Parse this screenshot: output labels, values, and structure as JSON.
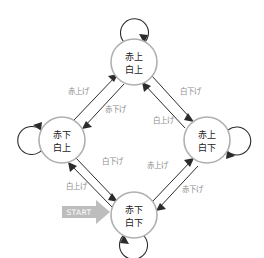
{
  "diagram": {
    "nodes": [
      {
        "id": "top",
        "line1": "赤上",
        "line2": "白上",
        "cx": 134,
        "cy": 62,
        "r": 23
      },
      {
        "id": "left",
        "line1": "赤下",
        "line2": "白上",
        "cx": 62,
        "cy": 140,
        "r": 23
      },
      {
        "id": "right",
        "line1": "赤上",
        "line2": "白下",
        "cx": 207,
        "cy": 140,
        "r": 23
      },
      {
        "id": "bottom",
        "line1": "赤下",
        "line2": "白下",
        "cx": 134,
        "cy": 215,
        "r": 23
      }
    ],
    "edge_labels": {
      "left_to_top": "赤上げ",
      "top_to_left": "赤下げ",
      "top_to_right": "白下げ",
      "right_to_top": "白上げ",
      "left_to_bottom": "白下げ",
      "bottom_to_left": "白上げ",
      "bottom_to_right": "赤上げ",
      "right_to_bottom": "赤下げ"
    },
    "start": {
      "label": "START"
    },
    "self_loops": [
      {
        "id": "top-self-loop",
        "node": "top"
      },
      {
        "id": "left-self-loop",
        "node": "left"
      },
      {
        "id": "right-self-loop",
        "node": "right"
      },
      {
        "id": "bottom-self-loop",
        "node": "bottom"
      }
    ],
    "colors": {
      "node_stroke": "#b0b0b0",
      "node_fill": "#ffffff",
      "node_text": "#1a1a1a",
      "edge": "#2b2b2b",
      "edge_label_text": "#8c8c8c",
      "start_arrow": "#bdbdbd",
      "start_text": "#ffffff",
      "background": "#ffffff"
    }
  }
}
